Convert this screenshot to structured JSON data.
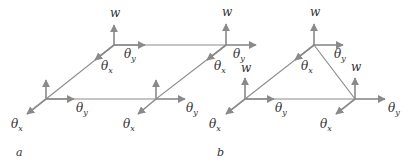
{
  "colors": {
    "background": "#ffffff",
    "arrow": "#8a8a8a",
    "edge": "#8c8c8c",
    "fill_dark": "#c9c9c9",
    "fill_light": "#f2f2f2",
    "text": "#333333"
  },
  "symbols": {
    "w": "w",
    "theta": "θ",
    "x": "x",
    "y": "y"
  },
  "figures": [
    {
      "id": "a",
      "caption": "a",
      "caption_pos": [
        16,
        156
      ],
      "shape": "parallelogram",
      "polygon": [
        [
          46,
          99
        ],
        [
          114,
          45
        ],
        [
          226,
          45
        ],
        [
          156,
          99
        ]
      ],
      "nodes": [
        {
          "pos": [
            46,
            99
          ],
          "w_tip": [
            46,
            80
          ],
          "w_label": null,
          "ty_tip": [
            74,
            99
          ],
          "ty_label": [
            76,
            112
          ],
          "tx_tip": [
            27,
            114
          ],
          "tx_label": [
            11,
            128
          ]
        },
        {
          "pos": [
            114,
            45
          ],
          "w_tip": [
            114,
            25
          ],
          "w_label": [
            110,
            17
          ],
          "ty_tip": [
            145,
            45
          ],
          "ty_label": [
            124,
            58
          ],
          "tx_tip": [
            95,
            60
          ],
          "tx_label": [
            101,
            70
          ]
        },
        {
          "pos": [
            226,
            45
          ],
          "w_tip": [
            226,
            24
          ],
          "w_label": [
            222,
            16
          ],
          "ty_tip": [
            256,
            45
          ],
          "ty_label": [
            233,
            58
          ],
          "tx_tip": [
            207,
            60
          ],
          "tx_label": [
            214,
            70
          ]
        },
        {
          "pos": [
            156,
            99
          ],
          "w_tip": [
            156,
            80
          ],
          "w_label": null,
          "ty_tip": [
            185,
            99
          ],
          "ty_label": [
            186,
            112
          ],
          "tx_tip": [
            138,
            114
          ],
          "tx_label": [
            123,
            128
          ]
        }
      ]
    },
    {
      "id": "b",
      "caption": "b",
      "caption_pos": [
        217,
        156
      ],
      "shape": "triangle",
      "polygon": [
        [
          245,
          99
        ],
        [
          314,
          45
        ],
        [
          355,
          99
        ]
      ],
      "nodes": [
        {
          "pos": [
            245,
            99
          ],
          "w_tip": [
            245,
            78
          ],
          "w_label": [
            241,
            72
          ],
          "ty_tip": [
            274,
            99
          ],
          "ty_label": [
            275,
            112
          ],
          "tx_tip": [
            226,
            114
          ],
          "tx_label": [
            209,
            128
          ]
        },
        {
          "pos": [
            314,
            45
          ],
          "w_tip": [
            314,
            24
          ],
          "w_label": [
            310,
            16
          ],
          "ty_tip": [
            343,
            45
          ],
          "ty_label": [
            334,
            58
          ],
          "tx_tip": [
            295,
            60
          ],
          "tx_label": [
            301,
            70
          ]
        },
        {
          "pos": [
            355,
            99
          ],
          "w_tip": [
            355,
            78
          ],
          "w_label": [
            351,
            71
          ],
          "ty_tip": [
            385,
            99
          ],
          "ty_label": [
            388,
            112
          ],
          "tx_tip": [
            336,
            114
          ],
          "tx_label": [
            320,
            128
          ]
        }
      ]
    }
  ]
}
